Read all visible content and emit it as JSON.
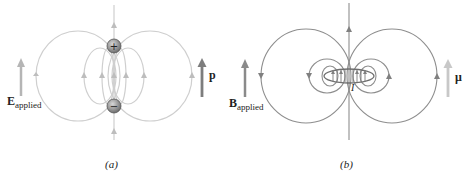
{
  "panels": [
    {
      "id": "a",
      "caption": "(a)",
      "applied_field": {
        "symbol": "E",
        "subscript": "applied"
      },
      "moment": {
        "symbol": "p"
      },
      "charges": [
        {
          "sign": "+"
        },
        {
          "sign": "−"
        }
      ],
      "description": "Electric dipole field lines between a positive (top) and negative (bottom) charge"
    },
    {
      "id": "b",
      "caption": "(b)",
      "applied_field": {
        "symbol": "B",
        "subscript": "applied"
      },
      "moment": {
        "symbol": "μ"
      },
      "current_label": "I",
      "description": "Magnetic dipole field lines around a current loop"
    }
  ],
  "colors": {
    "field_line_a": "#c8c8c8",
    "field_line_b": "#8c8c8c",
    "arrow_applied": "#a8a8a8",
    "arrow_p": "#7a7a7a",
    "arrow_mu": "#c4c4c4",
    "charge_fill": "#8a8a8a"
  }
}
